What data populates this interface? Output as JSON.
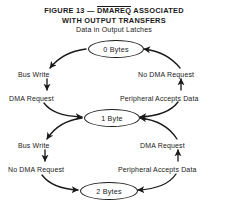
{
  "figure": {
    "title_prefix": "FIGURE 13 — ",
    "title_signal": "DMAREQ",
    "title_suffix": " ASSOCIATED",
    "title_line2": "WITH OUTPUT TRANSFERS",
    "subtitle": "Data in Output Latches"
  },
  "states": [
    {
      "id": "0-bytes",
      "label": "0 Bytes"
    },
    {
      "id": "1-byte",
      "label": "1 Byte"
    },
    {
      "id": "2-bytes",
      "label": "2 Bytes"
    }
  ],
  "transitions": [
    {
      "id": "zero-to-one",
      "from": "0 Bytes",
      "to": "1 Byte",
      "side": "left",
      "direction": "down",
      "labels": [
        "Bus Write",
        "DMA Request"
      ]
    },
    {
      "id": "one-to-zero",
      "from": "1 Byte",
      "to": "0 Bytes",
      "side": "right",
      "direction": "up",
      "labels": [
        "No DMA Request",
        "Peripheral Accepts Data"
      ]
    },
    {
      "id": "one-to-two",
      "from": "1 Byte",
      "to": "2 Bytes",
      "side": "left",
      "direction": "down",
      "labels": [
        "Bus Write",
        "No DMA Request"
      ]
    },
    {
      "id": "two-to-one",
      "from": "2 Bytes",
      "to": "1 Byte",
      "side": "right",
      "direction": "up",
      "labels": [
        "DMA Request",
        "Peripheral Accepts Data"
      ]
    }
  ],
  "edge_labels": {
    "bus_write_upper": "Bus Write",
    "dma_request_upper": "DMA Request",
    "no_dma_request_upper": "No DMA Request",
    "peripheral_accepts_data_upper": "Peripheral Accepts Data",
    "bus_write_lower": "Bus Write",
    "no_dma_request_lower": "No DMA Request",
    "dma_request_lower": "DMA Request",
    "peripheral_accepts_data_lower": "Peripheral Accepts Data"
  },
  "colors": {
    "ink": "#1a1a1a",
    "background": "#ffffff"
  }
}
